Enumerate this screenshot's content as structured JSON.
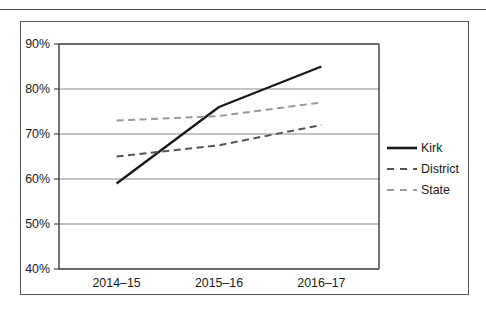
{
  "figure": {
    "background_color": "#ffffff",
    "frame_color": "#565656",
    "rule_color": "#4a4a4a"
  },
  "chart_data": {
    "type": "line",
    "title": "",
    "subtitle": "",
    "xlabel": "",
    "ylabel": "",
    "categories": [
      "2014–15",
      "2015–16",
      "2016–17"
    ],
    "x": [
      0,
      1,
      2
    ],
    "ylim": [
      40,
      90
    ],
    "yticks": [
      40,
      50,
      60,
      70,
      80,
      90
    ],
    "ytick_labels": [
      "40%",
      "50%",
      "60%",
      "70%",
      "80%",
      "90%"
    ],
    "xtick_labels": [
      "2014–15",
      "2015–16",
      "2016–17"
    ],
    "grid": true,
    "grid_axis": "y",
    "grid_color": "#8a8a8a",
    "legend_position": "right",
    "value_suffix": "%",
    "series": [
      {
        "name": "Kirk",
        "values": [
          59,
          76,
          85
        ],
        "color": "#1a1a1a",
        "linestyle": "solid",
        "linewidth": 2.4
      },
      {
        "name": "District",
        "values": [
          65,
          67.5,
          72
        ],
        "color": "#555555",
        "linestyle": "dashed",
        "linewidth": 2.0
      },
      {
        "name": "State",
        "values": [
          73,
          74,
          77
        ],
        "color": "#9b9b9b",
        "linestyle": "dashed",
        "linewidth": 2.0
      }
    ]
  },
  "legend": {
    "entries": [
      {
        "label": "Kirk",
        "color": "#1a1a1a",
        "linestyle": "solid"
      },
      {
        "label": "District",
        "color": "#555555",
        "linestyle": "dashed"
      },
      {
        "label": "State",
        "color": "#9b9b9b",
        "linestyle": "dashed"
      }
    ]
  }
}
